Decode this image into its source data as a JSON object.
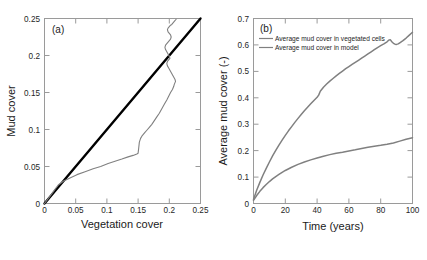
{
  "figure": {
    "background_color": "#ffffff",
    "gray_color": "#808080",
    "black_color": "#000000",
    "axis_color": "#9a9a9a"
  },
  "panel_a": {
    "tag": "(a)",
    "xlabel": "Vegetation cover",
    "ylabel": "Mud cover",
    "xticks": [
      "0",
      "0.05",
      "0.1",
      "0.15",
      "0.2",
      "0.25"
    ],
    "yticks": [
      "0",
      "0.05",
      "0.1",
      "0.15",
      "0.2",
      "0.25"
    ]
  },
  "panel_b": {
    "tag": "(b)",
    "xlabel": "Time (years)",
    "ylabel": "Average mud cover (-)",
    "xticks": [
      "0",
      "20",
      "40",
      "60",
      "80",
      "100"
    ],
    "yticks": [
      "0",
      "0.1",
      "0.2",
      "0.3",
      "0.4",
      "0.5",
      "0.6",
      "0.7"
    ],
    "legend": [
      "Average mud cover in vegetated cells",
      "Average mud cover in model"
    ]
  },
  "chart_data": [
    {
      "type": "line",
      "title": "(a)",
      "xlabel": "Vegetation cover",
      "ylabel": "Mud cover",
      "xlim": [
        0,
        0.25
      ],
      "ylim": [
        0,
        0.25
      ],
      "xticks": [
        0,
        0.05,
        0.1,
        0.15,
        0.2,
        0.25
      ],
      "yticks": [
        0,
        0.05,
        0.1,
        0.15,
        0.2,
        0.25
      ],
      "grid": false,
      "legend_position": "none",
      "series": [
        {
          "name": "1:1 reference line",
          "color": "#000000",
          "linewidth": 2.4,
          "x": [
            0,
            0.25
          ],
          "y": [
            0,
            0.25
          ]
        },
        {
          "name": "mud cover vs vegetation cover trajectory",
          "color": "#808080",
          "linewidth": 1.1,
          "x": [
            0.0,
            0.008,
            0.015,
            0.022,
            0.03,
            0.04,
            0.052,
            0.065,
            0.078,
            0.09,
            0.102,
            0.113,
            0.124,
            0.134,
            0.142,
            0.148,
            0.15,
            0.151,
            0.152,
            0.154,
            0.156,
            0.158,
            0.161,
            0.164,
            0.168,
            0.172,
            0.176,
            0.18,
            0.184,
            0.188,
            0.192,
            0.196,
            0.199,
            0.202,
            0.205,
            0.207,
            0.208,
            0.209,
            0.21,
            0.209,
            0.207,
            0.205,
            0.203,
            0.201,
            0.199,
            0.197,
            0.196,
            0.197,
            0.199,
            0.201,
            0.2,
            0.198,
            0.196,
            0.194,
            0.193,
            0.194,
            0.196,
            0.198,
            0.2,
            0.202,
            0.203,
            0.202,
            0.2,
            0.198,
            0.197,
            0.198,
            0.2,
            0.202,
            0.204,
            0.205,
            0.206,
            0.207,
            0.208,
            0.209,
            0.21,
            0.211
          ],
          "y": [
            0.0,
            0.009,
            0.017,
            0.025,
            0.03,
            0.034,
            0.039,
            0.043,
            0.047,
            0.05,
            0.054,
            0.057,
            0.06,
            0.063,
            0.065,
            0.067,
            0.068,
            0.075,
            0.083,
            0.088,
            0.091,
            0.093,
            0.096,
            0.099,
            0.103,
            0.107,
            0.112,
            0.117,
            0.122,
            0.128,
            0.134,
            0.14,
            0.145,
            0.15,
            0.154,
            0.158,
            0.161,
            0.163,
            0.165,
            0.168,
            0.171,
            0.174,
            0.177,
            0.18,
            0.183,
            0.186,
            0.189,
            0.192,
            0.194,
            0.196,
            0.199,
            0.202,
            0.205,
            0.208,
            0.211,
            0.214,
            0.216,
            0.218,
            0.22,
            0.222,
            0.225,
            0.228,
            0.23,
            0.232,
            0.235,
            0.237,
            0.239,
            0.241,
            0.242,
            0.243,
            0.244,
            0.245,
            0.246,
            0.247,
            0.248,
            0.249
          ]
        }
      ]
    },
    {
      "type": "line",
      "title": "(b)",
      "xlabel": "Time (years)",
      "ylabel": "Average mud cover (-)",
      "xlim": [
        0,
        100
      ],
      "ylim": [
        0,
        0.7
      ],
      "xticks": [
        0,
        20,
        40,
        60,
        80,
        100
      ],
      "yticks": [
        0,
        0.1,
        0.2,
        0.3,
        0.4,
        0.5,
        0.6,
        0.7
      ],
      "grid": false,
      "legend_position": "upper left",
      "series": [
        {
          "name": "Average mud cover in vegetated cells",
          "color": "#808080",
          "linewidth": 1.5,
          "x": [
            0,
            2,
            4,
            6,
            8,
            10,
            12,
            14,
            16,
            18,
            20,
            22,
            24,
            26,
            28,
            30,
            32,
            34,
            36,
            38,
            40,
            41,
            42,
            44,
            46,
            48,
            50,
            52,
            54,
            56,
            58,
            60,
            62,
            64,
            66,
            68,
            70,
            72,
            74,
            76,
            78,
            80,
            82,
            84,
            85,
            86,
            87,
            88,
            89,
            90,
            91,
            92,
            94,
            96,
            98,
            100
          ],
          "y": [
            0.015,
            0.05,
            0.08,
            0.108,
            0.133,
            0.157,
            0.18,
            0.201,
            0.221,
            0.24,
            0.258,
            0.275,
            0.291,
            0.307,
            0.322,
            0.337,
            0.351,
            0.364,
            0.377,
            0.39,
            0.402,
            0.41,
            0.425,
            0.44,
            0.452,
            0.463,
            0.473,
            0.483,
            0.492,
            0.501,
            0.51,
            0.518,
            0.526,
            0.534,
            0.542,
            0.55,
            0.558,
            0.566,
            0.574,
            0.582,
            0.59,
            0.597,
            0.604,
            0.612,
            0.618,
            0.62,
            0.612,
            0.606,
            0.603,
            0.602,
            0.604,
            0.608,
            0.616,
            0.626,
            0.637,
            0.648
          ]
        },
        {
          "name": "Average mud cover in model",
          "color": "#808080",
          "linewidth": 1.5,
          "x": [
            0,
            2,
            4,
            6,
            8,
            10,
            12,
            14,
            16,
            18,
            20,
            24,
            28,
            32,
            36,
            40,
            44,
            48,
            52,
            56,
            60,
            64,
            68,
            72,
            76,
            80,
            84,
            88,
            92,
            96,
            100
          ],
          "y": [
            0.012,
            0.03,
            0.046,
            0.06,
            0.072,
            0.083,
            0.093,
            0.102,
            0.11,
            0.118,
            0.125,
            0.137,
            0.148,
            0.157,
            0.165,
            0.172,
            0.179,
            0.185,
            0.19,
            0.194,
            0.199,
            0.203,
            0.208,
            0.213,
            0.217,
            0.22,
            0.224,
            0.229,
            0.236,
            0.243,
            0.249
          ]
        }
      ]
    }
  ]
}
